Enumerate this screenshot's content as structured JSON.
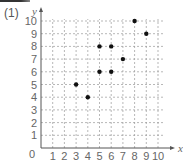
{
  "problem_label": "(1)",
  "chart_data": {
    "type": "scatter",
    "title": "",
    "xlabel": "x",
    "ylabel": "y",
    "xlim": [
      0,
      10
    ],
    "ylim": [
      0,
      10
    ],
    "grid": true,
    "x_ticks": [
      "1",
      "2",
      "3",
      "4",
      "5",
      "6",
      "7",
      "8",
      "9",
      "10"
    ],
    "y_ticks": [
      "1",
      "2",
      "3",
      "4",
      "5",
      "6",
      "7",
      "8",
      "9",
      "10"
    ],
    "origin_label": "0",
    "points": [
      {
        "x": 3,
        "y": 5
      },
      {
        "x": 4,
        "y": 4
      },
      {
        "x": 5,
        "y": 6
      },
      {
        "x": 5,
        "y": 8
      },
      {
        "x": 6,
        "y": 6
      },
      {
        "x": 6,
        "y": 8
      },
      {
        "x": 7,
        "y": 7
      },
      {
        "x": 8,
        "y": 10
      },
      {
        "x": 9,
        "y": 9
      }
    ]
  },
  "colors": {
    "axis": "#555555",
    "grid": "#999999",
    "point": "#111111",
    "text": "#666666"
  }
}
